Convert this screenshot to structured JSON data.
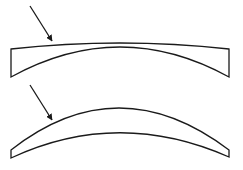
{
  "diagram": {
    "background": "#ffffff",
    "stroke_color": "#1a1a1a",
    "figures": [
      {
        "name": "flat-top-lens",
        "description": "Plano-concave segment with nearly flat top surface and concave underside",
        "arrow": {
          "from": [
            30,
            6
          ],
          "to": [
            53,
            43
          ]
        }
      },
      {
        "name": "curved-meniscus-lens",
        "description": "Curved meniscus strip with parallel arcs",
        "arrow": {
          "from": [
            30,
            85
          ],
          "to": [
            53,
            122
          ]
        }
      }
    ]
  }
}
